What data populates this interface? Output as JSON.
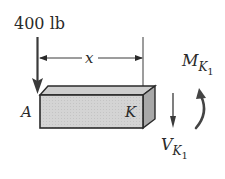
{
  "diagram": {
    "type": "free-body section of beam",
    "load": {
      "value": "400 lb",
      "point": "A"
    },
    "dimension": {
      "label": "x",
      "from": "A",
      "to": "K"
    },
    "points": {
      "left": "A",
      "right": "K"
    },
    "shear": {
      "symbol": "V",
      "subscript": "K",
      "sub_index": "1"
    },
    "moment": {
      "symbol": "M",
      "subscript": "K",
      "sub_index": "1"
    },
    "colors": {
      "ink": "#2a2a2a",
      "box_front": "#d6d6d6",
      "box_top": "#cbcbcb",
      "box_side": "#a9a9a9"
    }
  }
}
